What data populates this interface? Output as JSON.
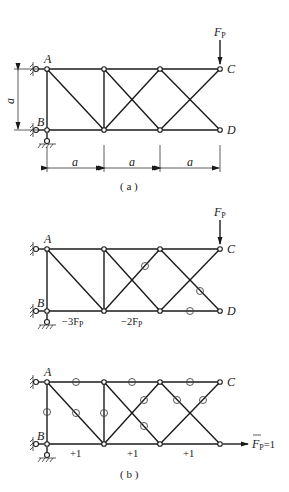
{
  "figure_a": {
    "caption": "( a )",
    "node_labels": {
      "A": "A",
      "B": "B",
      "C": "C",
      "D": "D"
    },
    "load_label": "F",
    "load_sub": "P",
    "dim_height": "a",
    "dim_spans": [
      "a",
      "a",
      "a"
    ]
  },
  "figure_b1": {
    "node_labels": {
      "A": "A",
      "B": "B",
      "C": "C",
      "D": "D"
    },
    "load_label": "F",
    "load_sub": "P",
    "member_forces": [
      {
        "member": "B-bottom1",
        "label": "−3F",
        "sub": "P"
      },
      {
        "member": "bottom2",
        "label": "−2F",
        "sub": "P"
      }
    ],
    "zero_force_marks": 3
  },
  "figure_b2": {
    "caption": "( b )",
    "node_labels": {
      "A": "A",
      "B": "B",
      "C": "C"
    },
    "load_label": "F",
    "load_sub": "P",
    "load_value": "=1",
    "member_forces": [
      "+1",
      "+1",
      "+1"
    ],
    "zero_force_marks": 10
  }
}
